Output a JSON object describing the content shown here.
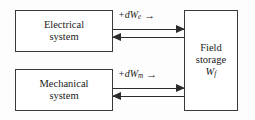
{
  "diagram": {
    "background_color": "#fdfdfd",
    "line_color": "#2b2b2b",
    "box_border_color": "#3a3a3a",
    "text_color": "#1a1a1a"
  },
  "boxes": {
    "electrical": {
      "line1": "Electrical",
      "line2": "system"
    },
    "mechanical": {
      "line1": "Mechanical",
      "line2": "system"
    },
    "field": {
      "line1": "Field",
      "line2": "storage",
      "symbol": "W",
      "symbol_sub": "f"
    }
  },
  "connectors": {
    "electrical": {
      "sign": "+",
      "differential": "dW",
      "subscript": "e",
      "label_text": "+dWe",
      "arrow_glyph": "→",
      "forward_direction": "right",
      "backward_direction": "left"
    },
    "mechanical": {
      "sign": "+",
      "differential": "dW",
      "subscript": "m",
      "label_text": "+dWm",
      "arrow_glyph": "→",
      "forward_direction": "right",
      "backward_direction": "left"
    }
  }
}
